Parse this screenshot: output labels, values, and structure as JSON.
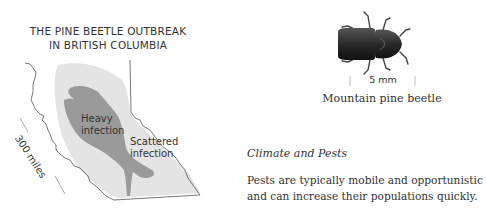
{
  "map": {
    "title_line1": "THE PINE BEETLE OUTBREAK",
    "title_line2": "IN BRITISH COLUMBIA",
    "heavy_label_line1": "Heavy",
    "heavy_label_line2": "infection",
    "scattered_label_line1": "Scattered",
    "scattered_label_line2": "infection",
    "scale_label": "300 miles",
    "colors": {
      "heavy": "#9a9a9a",
      "scattered": "#e4e4e4",
      "border": "#555555"
    }
  },
  "beetle": {
    "scale_label": "5 mm",
    "caption": "Mountain pine beetle"
  },
  "article": {
    "heading": "Climate and Pests",
    "paragraph_line1": "Pests are typically mobile and opportunistic",
    "paragraph_line2": "and can increase their populations quickly."
  }
}
